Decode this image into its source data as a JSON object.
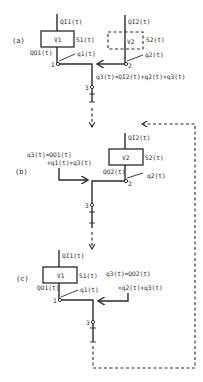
{
  "panels": {
    "a": {
      "label": "(a)",
      "reservoir1": {
        "name": "V1",
        "inflow": "QI1(t)",
        "storage": "S1(t)",
        "outflow": "QO1(t)",
        "local": "q1(t)",
        "node": "1"
      },
      "reservoir2": {
        "name": "V2",
        "inflow": "QI2(t)",
        "storage": "S2(t)",
        "local": "q2(t)",
        "node": "2",
        "style": "dashed"
      },
      "junction_node": "3",
      "equation": "q3(t)=QI2(t)+q2(t)+q3(t)"
    },
    "b": {
      "label": "(b)",
      "reservoir2": {
        "name": "V2",
        "inflow": "QI2(t)",
        "storage": "S2(t)",
        "outflow": "QO2(t)",
        "local": "q2(t)",
        "node": "2"
      },
      "junction_node": "3",
      "equation_line1": "q3(t)=QO1(t)",
      "equation_line2": "+q1(t)+q3(t)"
    },
    "c": {
      "label": "(c)",
      "reservoir1": {
        "name": "V1",
        "inflow": "QI1(t)",
        "storage": "S1(t)",
        "outflow": "QO1(t)",
        "local": "q1(t)",
        "node": "1"
      },
      "junction_node": "3",
      "equation_line1": "q3(t)=QO2(t)",
      "equation_line2": "+q2(t)+q3(t)"
    }
  }
}
